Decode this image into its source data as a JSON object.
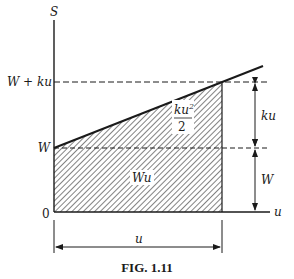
{
  "figure": {
    "caption": "FIG. 1.11",
    "axes": {
      "y_label": "S",
      "x_label": "u",
      "origin_label": "0"
    },
    "y_ticks": {
      "top": "W + ku",
      "base": "W"
    },
    "regions": {
      "triangle_label_num": "ku",
      "triangle_label_sup": "2",
      "triangle_label_den": "2",
      "rectangle_label": "Wu"
    },
    "dimensions": {
      "right_upper": "ku",
      "right_lower": "W",
      "bottom": "u"
    },
    "colors": {
      "ink": "#1a1a1a",
      "background": "#ffffff"
    }
  }
}
